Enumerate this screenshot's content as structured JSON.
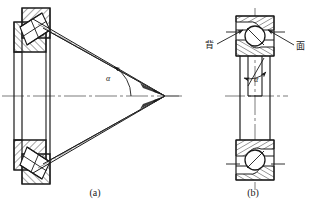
{
  "figure": {
    "background_color": "#ffffff",
    "line_color": "#1a1a1a",
    "hatch_color": "#1a1a1a",
    "centerline_color": "#555555",
    "subfigures": [
      {
        "id": "a",
        "caption": "(a)",
        "name": "tapered-roller-bearing",
        "angle_label": "α",
        "description": "tapered roller bearing cross-section with contact angle lines converging at apex"
      },
      {
        "id": "b",
        "caption": "(b)",
        "name": "angular-contact-ball-bearing",
        "angle_label": "α",
        "leader_labels": [
          {
            "text": "背",
            "side": "left"
          },
          {
            "text": "面",
            "side": "right"
          }
        ],
        "description": "angular contact ball bearing cross-section with back and face designations"
      }
    ]
  }
}
